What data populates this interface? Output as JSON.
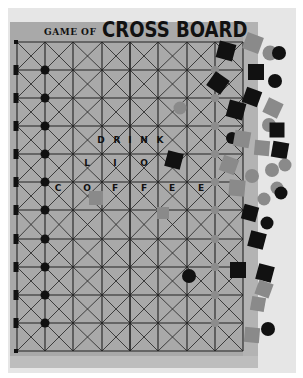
{
  "title": {
    "prefix": "GAME OF",
    "main": "CROSS BOARD"
  },
  "board_text": {
    "line1": [
      "D",
      "R",
      "I",
      "N",
      "K"
    ],
    "line2": [
      "L",
      "I",
      "O"
    ],
    "line3": [
      "C",
      "O",
      "F",
      "F",
      "E",
      "E"
    ]
  },
  "colors": {
    "background": "#ffffff",
    "backdrop": "#e6e6e6",
    "board": "#a9a9a9",
    "grid_lines": "#222222",
    "black_piece": "#111111",
    "gray_piece": "#8a8a8a"
  },
  "grid": {
    "columns": 8,
    "rows": 11,
    "x_lines": [
      17,
      45,
      73,
      102,
      130,
      158,
      187,
      215,
      243
    ],
    "y_lines": [
      42,
      70,
      98,
      126,
      154,
      182,
      210,
      239,
      267,
      295,
      323,
      351
    ]
  },
  "pieces": [
    {
      "shape": "square",
      "color": "black",
      "x": 226,
      "y": 51,
      "size": 17,
      "rot": 15
    },
    {
      "shape": "square",
      "color": "gray",
      "x": 253,
      "y": 43,
      "size": 17,
      "rot": 20
    },
    {
      "shape": "circle",
      "color": "gray",
      "x": 270,
      "y": 53,
      "size": 15
    },
    {
      "shape": "circle",
      "color": "black",
      "x": 279,
      "y": 53,
      "size": 14
    },
    {
      "shape": "square",
      "color": "black",
      "x": 218,
      "y": 83,
      "size": 17,
      "rot": 35
    },
    {
      "shape": "square",
      "color": "black",
      "x": 256,
      "y": 72,
      "size": 16,
      "rot": 0
    },
    {
      "shape": "circle",
      "color": "black",
      "x": 275,
      "y": 81,
      "size": 14
    },
    {
      "shape": "square",
      "color": "black",
      "x": 252,
      "y": 97,
      "size": 16,
      "rot": 20
    },
    {
      "shape": "square",
      "color": "black",
      "x": 236,
      "y": 110,
      "size": 17,
      "rot": 15
    },
    {
      "shape": "square",
      "color": "gray",
      "x": 273,
      "y": 108,
      "size": 16,
      "rot": 25
    },
    {
      "shape": "circle",
      "color": "gray",
      "x": 180,
      "y": 108,
      "size": 13
    },
    {
      "shape": "circle",
      "color": "gray",
      "x": 269,
      "y": 125,
      "size": 14
    },
    {
      "shape": "square",
      "color": "black",
      "x": 277,
      "y": 130,
      "size": 15,
      "rot": 0
    },
    {
      "shape": "circle",
      "color": "black",
      "x": 232,
      "y": 138,
      "size": 12
    },
    {
      "shape": "square",
      "color": "gray",
      "x": 242,
      "y": 139,
      "size": 16,
      "rot": 10
    },
    {
      "shape": "square",
      "color": "gray",
      "x": 262,
      "y": 148,
      "size": 15,
      "rot": 5
    },
    {
      "shape": "square",
      "color": "black",
      "x": 280,
      "y": 150,
      "size": 16,
      "rot": 10
    },
    {
      "shape": "square",
      "color": "black",
      "x": 174,
      "y": 160,
      "size": 16,
      "rot": 15
    },
    {
      "shape": "square",
      "color": "gray",
      "x": 229,
      "y": 165,
      "size": 16,
      "rot": 20
    },
    {
      "shape": "circle",
      "color": "gray",
      "x": 272,
      "y": 170,
      "size": 14
    },
    {
      "shape": "circle",
      "color": "gray",
      "x": 285,
      "y": 165,
      "size": 13
    },
    {
      "shape": "circle",
      "color": "gray",
      "x": 252,
      "y": 176,
      "size": 14
    },
    {
      "shape": "circle",
      "color": "gray",
      "x": 277,
      "y": 188,
      "size": 13
    },
    {
      "shape": "circle",
      "color": "black",
      "x": 281,
      "y": 193,
      "size": 13
    },
    {
      "shape": "square",
      "color": "gray",
      "x": 237,
      "y": 188,
      "size": 16,
      "rot": 5
    },
    {
      "shape": "square",
      "color": "gray",
      "x": 96,
      "y": 198,
      "size": 14,
      "rot": 0
    },
    {
      "shape": "circle",
      "color": "gray",
      "x": 264,
      "y": 199,
      "size": 13
    },
    {
      "shape": "square",
      "color": "gray",
      "x": 163,
      "y": 213,
      "size": 12,
      "rot": 0
    },
    {
      "shape": "square",
      "color": "black",
      "x": 250,
      "y": 213,
      "size": 15,
      "rot": 15
    },
    {
      "shape": "circle",
      "color": "black",
      "x": 267,
      "y": 223,
      "size": 13
    },
    {
      "shape": "square",
      "color": "black",
      "x": 257,
      "y": 240,
      "size": 16,
      "rot": 15
    },
    {
      "shape": "square",
      "color": "black",
      "x": 238,
      "y": 270,
      "size": 16,
      "rot": 0
    },
    {
      "shape": "square",
      "color": "black",
      "x": 265,
      "y": 273,
      "size": 16,
      "rot": 15
    },
    {
      "shape": "circle",
      "color": "black",
      "x": 189,
      "y": 276,
      "size": 14
    },
    {
      "shape": "square",
      "color": "gray",
      "x": 264,
      "y": 289,
      "size": 15,
      "rot": 20
    },
    {
      "shape": "square",
      "color": "gray",
      "x": 258,
      "y": 304,
      "size": 14,
      "rot": 10
    },
    {
      "shape": "circle",
      "color": "black",
      "x": 268,
      "y": 329,
      "size": 14
    },
    {
      "shape": "square",
      "color": "gray",
      "x": 252,
      "y": 335,
      "size": 15,
      "rot": 5
    }
  ]
}
